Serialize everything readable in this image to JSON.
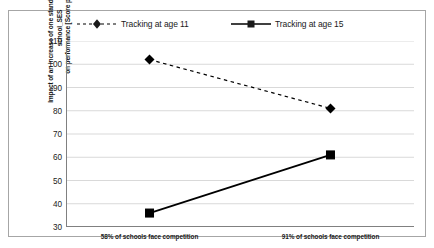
{
  "chart_data": {
    "type": "line",
    "title": "",
    "xlabel": "",
    "ylabel": "Impact of an increase of one standard deviation in school_SES on performance [Score points]",
    "ylabel_line1": "Impact of an increase of one standard deviation in school_SES",
    "ylabel_line2": "on performance [Score points]",
    "categories": [
      "58% of schools face competition",
      "91% of schools face competition"
    ],
    "ylim": [
      30,
      110
    ],
    "yticks": [
      110,
      100,
      90,
      80,
      70,
      60,
      50,
      40,
      30
    ],
    "ytick_labels": [
      "110",
      "100",
      "90",
      "80",
      "70",
      "60",
      "50",
      "40",
      "30"
    ],
    "grid": true,
    "legend_position": "top",
    "series": [
      {
        "name": "Tracking at age 11",
        "values": [
          102,
          81
        ],
        "marker": "diamond",
        "linestyle": "dashed",
        "color": "#000000"
      },
      {
        "name": "Tracking at age 15",
        "values": [
          36,
          61
        ],
        "marker": "square",
        "linestyle": "solid",
        "color": "#000000"
      }
    ]
  },
  "legend": {
    "entries": [
      {
        "label": "Tracking at age 11",
        "key": "dashed-diamond-key"
      },
      {
        "label": "Tracking at age 15",
        "key": "solid-square-key"
      }
    ]
  },
  "colors": {
    "series": "#000000",
    "grid": "#d9d9d9",
    "axis": "#808080",
    "border": "#a6a6a6",
    "text": "#1a1a1a",
    "background": "#ffffff"
  }
}
